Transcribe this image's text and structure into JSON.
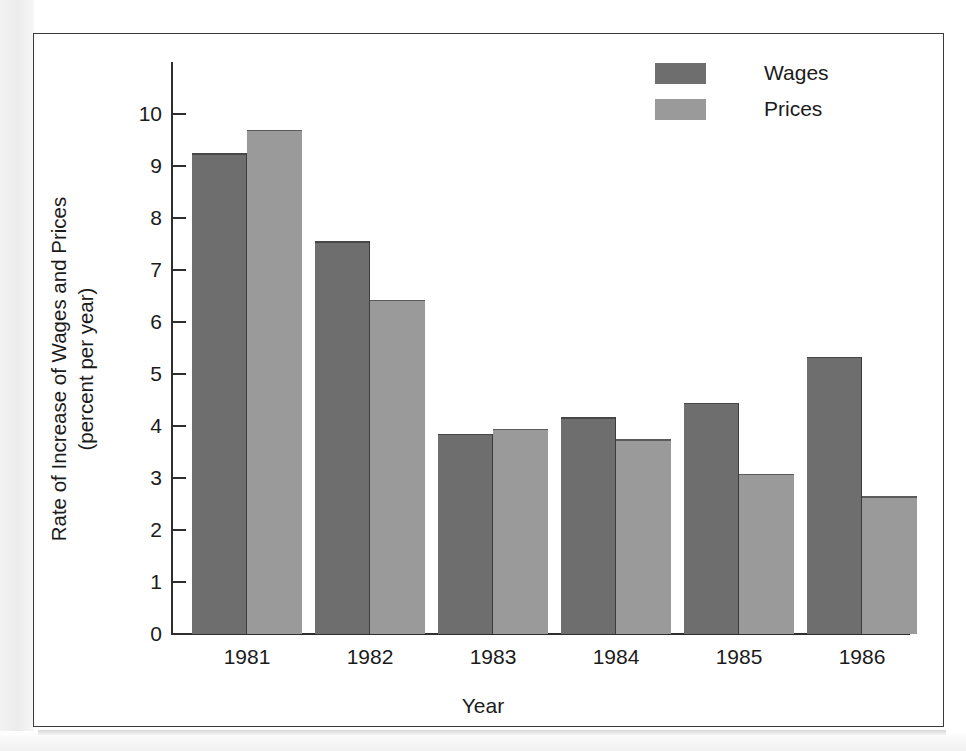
{
  "chart_data": {
    "type": "bar",
    "title": "",
    "xlabel": "Year",
    "ylabel": "Rate of Increase of Wages and Prices (percent per year)",
    "ylabel_line1": "Rate of Increase of Wages and Prices",
    "ylabel_line2": "(percent per year)",
    "categories": [
      "1981",
      "1982",
      "1983",
      "1984",
      "1985",
      "1986"
    ],
    "ylim": [
      0,
      10
    ],
    "ytick_labels": [
      "10",
      "9",
      "8",
      "7",
      "6",
      "5",
      "4",
      "3",
      "2",
      "1",
      "0"
    ],
    "ytick_values": [
      10,
      9,
      8,
      7,
      6,
      5,
      4,
      3,
      2,
      1,
      0
    ],
    "grid": false,
    "legend_position": "top-right",
    "series": [
      {
        "name": "Wages",
        "color": "#6e6e6e",
        "values": [
          9.25,
          7.55,
          3.85,
          4.17,
          4.45,
          5.33
        ]
      },
      {
        "name": "Prices",
        "color": "#9a9a9a",
        "values": [
          9.7,
          6.43,
          3.95,
          3.75,
          3.08,
          2.65
        ]
      }
    ]
  },
  "legend": {
    "items": [
      {
        "label": "Wages",
        "swatch": "wages"
      },
      {
        "label": "Prices",
        "swatch": "prices"
      }
    ]
  },
  "colors": {
    "wages": "#6e6e6e",
    "prices": "#9a9a9a",
    "axis": "#2e2e2e",
    "frame": "#3b3b3b",
    "text": "#1b1b1b"
  }
}
